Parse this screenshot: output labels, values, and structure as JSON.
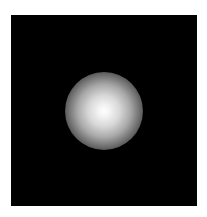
{
  "image": {
    "description": "Soft-edged white radial glow centered on a black square field",
    "background_color": "#000000",
    "page_color": "#ffffff",
    "glow": {
      "center_color": "#ffffff",
      "edge_color": "#000000",
      "shape": "circle"
    },
    "caption": ""
  }
}
